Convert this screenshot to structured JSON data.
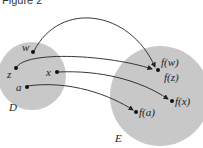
{
  "title": "Figure 2",
  "sets": {
    "domain": {
      "label": "D",
      "color": "#c8c8c8"
    },
    "codomain": {
      "label": "E",
      "color": "#c8c8c8"
    }
  },
  "points": {
    "w": "w",
    "z": "z",
    "x": "x",
    "a": "a",
    "fw": "f(w)",
    "fz": "f(z)",
    "fx": "f(x)",
    "fa": "f(a)"
  },
  "mappings": [
    {
      "from": "w",
      "to": "f(w)"
    },
    {
      "from": "z",
      "to": "f(z)"
    },
    {
      "from": "x",
      "to": "f(x)"
    },
    {
      "from": "a",
      "to": "f(a)"
    }
  ]
}
